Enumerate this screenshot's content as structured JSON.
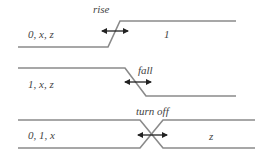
{
  "diagram": {
    "line_color": "#8a8a8a",
    "arrow_color": "#222222",
    "panels": [
      {
        "state_left": "0, x, z",
        "transition": "rise",
        "state_right": "1"
      },
      {
        "state_left": "1, x, z",
        "transition": "fall",
        "state_right": ""
      },
      {
        "state_left": "0, 1, x",
        "transition": "turn off",
        "state_right": "z"
      }
    ]
  }
}
